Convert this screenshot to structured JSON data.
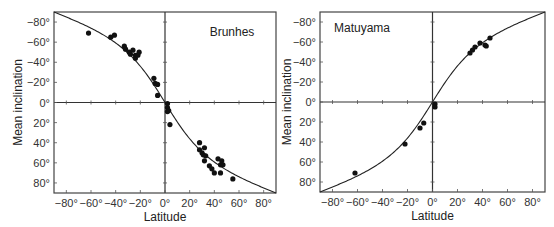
{
  "chart_data": [
    {
      "type": "scatter",
      "title": "Brunhes",
      "xlabel": "Latitude",
      "ylabel": "Mean inclination",
      "xlim": [
        -90,
        90
      ],
      "ylim": [
        -90,
        90
      ],
      "y_inverted": true,
      "x_ticks": [
        "-80°",
        "-60°",
        "-40°",
        "-20°",
        "0°",
        "20°",
        "40°",
        "60°",
        "80°"
      ],
      "y_ticks": [
        "-80°",
        "-60°",
        "-40°",
        "-20°",
        "0°",
        "20°",
        "40°",
        "60°",
        "80°"
      ],
      "grid": false,
      "curve": "dipole: tan(I) = 2 tan(latitude), normal polarity",
      "series": [
        {
          "name": "Site means",
          "points": [
            [
              -62,
              -69
            ],
            [
              -44,
              -65
            ],
            [
              -41,
              -67
            ],
            [
              -33,
              -56
            ],
            [
              -32,
              -53
            ],
            [
              -29,
              -50
            ],
            [
              -28,
              -48
            ],
            [
              -26,
              -52
            ],
            [
              -24,
              -47
            ],
            [
              -24,
              -44
            ],
            [
              -22,
              -47
            ],
            [
              -21,
              -50
            ],
            [
              -9,
              -24
            ],
            [
              -8,
              -19
            ],
            [
              -6,
              -18
            ],
            [
              -6,
              -7
            ],
            [
              2,
              1
            ],
            [
              2,
              5
            ],
            [
              2,
              9
            ],
            [
              3,
              8
            ],
            [
              4,
              22
            ],
            [
              28,
              40
            ],
            [
              28,
              47
            ],
            [
              30,
              50
            ],
            [
              31,
              52
            ],
            [
              32,
              45
            ],
            [
              33,
              53
            ],
            [
              32,
              58
            ],
            [
              36,
              63
            ],
            [
              38,
              66
            ],
            [
              40,
              70
            ],
            [
              43,
              56
            ],
            [
              45,
              62
            ],
            [
              46,
              58
            ],
            [
              47,
              62
            ],
            [
              45,
              70
            ],
            [
              55,
              76
            ]
          ]
        }
      ]
    },
    {
      "type": "scatter",
      "title": "Matuyama",
      "xlabel": "Latitude",
      "ylabel": "Mean inclination",
      "xlim": [
        -90,
        90
      ],
      "ylim": [
        -90,
        90
      ],
      "y_inverted": true,
      "x_ticks": [
        "-80°",
        "-60°",
        "-40°",
        "-20°",
        "0°",
        "20°",
        "40°",
        "60°",
        "80°"
      ],
      "y_ticks": [
        "-80°",
        "-60°",
        "-40°",
        "-20°",
        "0°",
        "20°",
        "40°",
        "60°",
        "80°"
      ],
      "grid": false,
      "curve": "dipole: tan(I) = 2 tan(latitude), reversed polarity",
      "series": [
        {
          "name": "Site means",
          "points": [
            [
              -62,
              71
            ],
            [
              -22,
              42
            ],
            [
              -10,
              26
            ],
            [
              -7,
              21
            ],
            [
              2,
              2
            ],
            [
              2,
              5
            ],
            [
              30,
              -49
            ],
            [
              32,
              -52
            ],
            [
              34,
              -55
            ],
            [
              38,
              -59
            ],
            [
              42,
              -57
            ],
            [
              43,
              -56
            ],
            [
              46,
              -64
            ]
          ]
        }
      ]
    }
  ],
  "panels": [
    {
      "title": "Brunhes",
      "xlabel": "Latitude",
      "ylabel": "Mean inclination"
    },
    {
      "title": "Matuyama",
      "xlabel": "Latitude",
      "ylabel": "Mean inclination"
    }
  ]
}
